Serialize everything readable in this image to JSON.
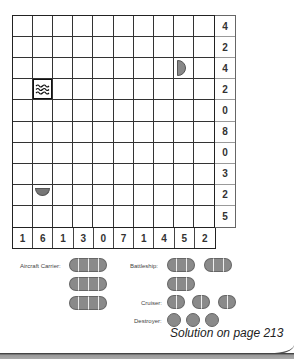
{
  "puzzle": {
    "type": "battleships",
    "grid_size": [
      10,
      10
    ],
    "row_clues": [
      "4",
      "2",
      "4",
      "2",
      "0",
      "8",
      "0",
      "3",
      "2",
      "5"
    ],
    "col_clues": [
      "1",
      "6",
      "1",
      "3",
      "0",
      "7",
      "1",
      "4",
      "5",
      "2"
    ],
    "given_cells": [
      {
        "row": 3,
        "col": 9,
        "kind": "ship-end-right",
        "icon": "ship-end-right-icon"
      },
      {
        "row": 4,
        "col": 2,
        "kind": "water",
        "icon": "water-waves-icon"
      },
      {
        "row": 9,
        "col": 2,
        "kind": "ship-end-bottom",
        "icon": "ship-end-bottom-icon"
      }
    ]
  },
  "legend": {
    "aircraft_carrier": {
      "label": "Aircraft Carrier:",
      "count": 3,
      "length": 4
    },
    "battleship": {
      "label": "Battleship:",
      "count": 3,
      "length": 3
    },
    "cruiser": {
      "label": "Cruiser:",
      "count": 3,
      "length": 2
    },
    "destroyer": {
      "label": "Destroyer:",
      "count": 3,
      "length": 1
    }
  },
  "footer": {
    "solution_text": "Solution on page 213"
  },
  "colors": {
    "ship_fill": "#8a8a8a",
    "grid_line": "#333333",
    "background": "#ffffff"
  }
}
